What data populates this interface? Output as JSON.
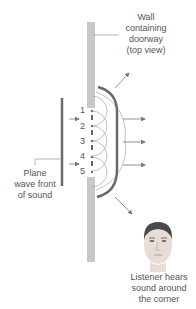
{
  "labels": {
    "wall": [
      "Wall",
      "containing",
      "doorway",
      "(top view)"
    ],
    "plane_wave": [
      "Plane",
      "wave front",
      "of sound"
    ],
    "listener": [
      "Listener hears",
      "sound around",
      "the corner"
    ]
  },
  "opening_points": [
    "1",
    "2",
    "3",
    "4",
    "5"
  ],
  "colors": {
    "wall": "#c8c8c8",
    "wavefront": "#6a6a6a",
    "arrow": "#777777",
    "wavelet": "#999999"
  }
}
